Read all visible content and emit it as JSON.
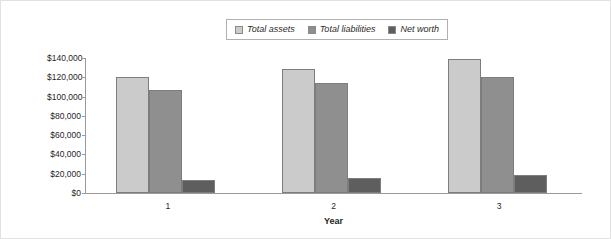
{
  "chart_data": {
    "type": "bar",
    "title": "",
    "xlabel": "Year",
    "ylabel": "",
    "categories": [
      "1",
      "2",
      "3"
    ],
    "series": [
      {
        "name": "Total assets",
        "color": "#cbcbcb",
        "values": [
          120000,
          129000,
          139000
        ]
      },
      {
        "name": "Total liabilities",
        "color": "#8f8f8f",
        "values": [
          107000,
          114000,
          120000
        ]
      },
      {
        "name": "Net worth",
        "color": "#5e5e5e",
        "values": [
          13000,
          16000,
          19000
        ]
      }
    ],
    "ylim": [
      0,
      140000
    ],
    "ytick_labels": [
      "$140,000",
      "$120,000",
      "$100,000",
      "$80,000",
      "$60,000",
      "$40,000",
      "$20,000",
      "$0"
    ],
    "ytick_values": [
      140000,
      120000,
      100000,
      80000,
      60000,
      40000,
      20000,
      0
    ],
    "grid": false,
    "legend_position": "top-center"
  },
  "legend": {
    "items": [
      {
        "label": "Total assets"
      },
      {
        "label": "Total liabilities"
      },
      {
        "label": "Net worth"
      }
    ]
  },
  "axes": {
    "x_title": "Year"
  }
}
